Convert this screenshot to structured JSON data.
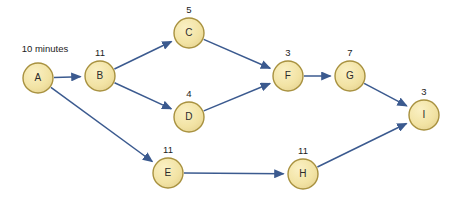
{
  "diagram": {
    "colors": {
      "node_fill": "#f2e3a4",
      "node_stroke": "#a8913f",
      "edge": "#3b5a8f",
      "text": "#1c1c1c",
      "background": "#ffffff"
    },
    "nodes": [
      {
        "id": "A",
        "label": "A",
        "duration": "10 minutes",
        "duration_wide": true,
        "cx": 38,
        "cy": 78,
        "r": 15,
        "label_x": 45,
        "label_y": 52
      },
      {
        "id": "B",
        "label": "B",
        "duration": "11",
        "duration_wide": false,
        "cx": 100,
        "cy": 76,
        "r": 15,
        "label_x": 100,
        "label_y": 56
      },
      {
        "id": "C",
        "label": "C",
        "duration": "5",
        "duration_wide": false,
        "cx": 189,
        "cy": 33,
        "r": 15,
        "label_x": 189,
        "label_y": 13
      },
      {
        "id": "D",
        "label": "D",
        "duration": "4",
        "duration_wide": false,
        "cx": 189,
        "cy": 117,
        "r": 15,
        "label_x": 189,
        "label_y": 97
      },
      {
        "id": "E",
        "label": "E",
        "duration": "11",
        "duration_wide": false,
        "cx": 168,
        "cy": 173,
        "r": 15,
        "label_x": 168,
        "label_y": 153
      },
      {
        "id": "F",
        "label": "F",
        "duration": "3",
        "duration_wide": false,
        "cx": 288,
        "cy": 76,
        "r": 15,
        "label_x": 288,
        "label_y": 56
      },
      {
        "id": "G",
        "label": "G",
        "duration": "7",
        "duration_wide": false,
        "cx": 350,
        "cy": 76,
        "r": 15,
        "label_x": 350,
        "label_y": 56
      },
      {
        "id": "H",
        "label": "H",
        "duration": "11",
        "duration_wide": false,
        "cx": 303,
        "cy": 174,
        "r": 15,
        "label_x": 303,
        "label_y": 154
      },
      {
        "id": "I",
        "label": "I",
        "duration": "3",
        "duration_wide": false,
        "cx": 424,
        "cy": 115,
        "r": 15,
        "label_x": 424,
        "label_y": 95
      }
    ],
    "edges": [
      {
        "from": "A",
        "to": "B",
        "name": "edge-a-b"
      },
      {
        "from": "A",
        "to": "E",
        "name": "edge-a-e"
      },
      {
        "from": "B",
        "to": "C",
        "name": "edge-b-c"
      },
      {
        "from": "B",
        "to": "D",
        "name": "edge-b-d"
      },
      {
        "from": "C",
        "to": "F",
        "name": "edge-c-f"
      },
      {
        "from": "D",
        "to": "F",
        "name": "edge-d-f"
      },
      {
        "from": "E",
        "to": "H",
        "name": "edge-e-h"
      },
      {
        "from": "F",
        "to": "G",
        "name": "edge-f-g"
      },
      {
        "from": "G",
        "to": "I",
        "name": "edge-g-i"
      },
      {
        "from": "H",
        "to": "I",
        "name": "edge-h-i"
      }
    ]
  }
}
